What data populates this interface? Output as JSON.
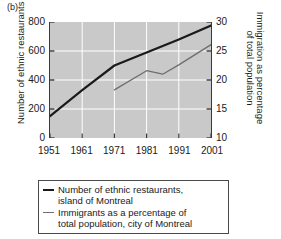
{
  "panel_label": "(b)",
  "chart_data": {
    "type": "line",
    "title": "",
    "subtitle": "",
    "xlabel": "",
    "ylabel": "Number of ethnic restaurants",
    "y2label": "Immigration as percentage of total population",
    "x": [
      1951,
      1961,
      1971,
      1981,
      1991,
      2001
    ],
    "xlim": [
      1951,
      2001
    ],
    "ylim": [
      0,
      800
    ],
    "y2lim": [
      10,
      30
    ],
    "xticks": [
      "1951",
      "1961",
      "1971",
      "1981",
      "1991",
      "2001"
    ],
    "yticks": [
      "0",
      "200",
      "400",
      "600",
      "800"
    ],
    "y2ticks": [
      "10",
      "15",
      "20",
      "25",
      "30"
    ],
    "grid": true,
    "grid_color": "#ffffff",
    "plot_background": "#c9c9c9",
    "legend_position": "below",
    "series": [
      {
        "name": "Number of ethnic restaurants, island of Montreal",
        "axis": "left",
        "color": "#1a1a1a",
        "width": 2.2,
        "points": [
          {
            "x": 1951,
            "y": 150
          },
          {
            "x": 1961,
            "y": 330
          },
          {
            "x": 1971,
            "y": 500
          },
          {
            "x": 1981,
            "y": 590
          },
          {
            "x": 1991,
            "y": 680
          },
          {
            "x": 2001,
            "y": 775
          }
        ]
      },
      {
        "name": "Immigrants as a percentage of total population, city of Montreal",
        "axis": "right",
        "color": "#6e6e6e",
        "width": 1.3,
        "points": [
          {
            "x": 1971,
            "y": 18.3
          },
          {
            "x": 1981,
            "y": 21.6
          },
          {
            "x": 1986,
            "y": 21.0
          },
          {
            "x": 1991,
            "y": 22.6
          },
          {
            "x": 2001,
            "y": 26.1
          }
        ]
      }
    ],
    "legend_entries": [
      {
        "style": "thick",
        "lines": [
          "Number of ethnic restaurants,",
          "island of Montreal"
        ]
      },
      {
        "style": "thin",
        "lines": [
          "Immigrants as a percentage of",
          "total population, city of Montreal"
        ]
      }
    ]
  }
}
